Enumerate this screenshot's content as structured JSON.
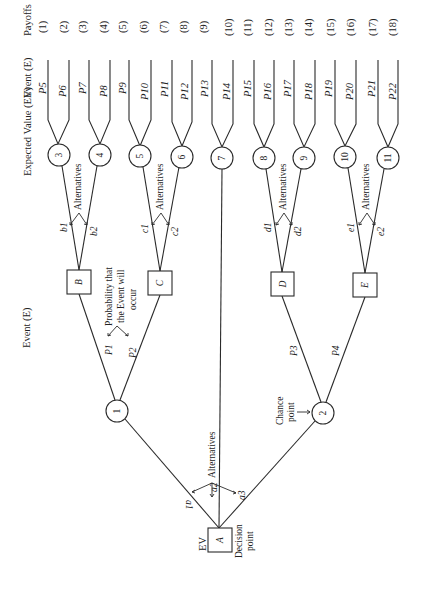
{
  "diagram": {
    "orientation": "rotated-90-ccw",
    "column_headers": {
      "payoffs": "Payoffs",
      "event_top": "Event (E)",
      "expected_value": "Expected Value (EV)",
      "event_bottom": "Event (E)"
    },
    "payoffs": [
      "(1)",
      "(2)",
      "(3)",
      "(4)",
      "(5)",
      "(6)",
      "(7)",
      "(8)",
      "(9)",
      "(10)",
      "(11)",
      "(12)",
      "(13)",
      "(14)",
      "(15)",
      "(16)",
      "(17)",
      "(18)"
    ],
    "events": [
      "P5",
      "P6",
      "P7",
      "P8",
      "P9",
      "P10",
      "P11",
      "P12",
      "P13",
      "P14",
      "P15",
      "P16",
      "P17",
      "P18",
      "P19",
      "P20",
      "P21",
      "P22"
    ],
    "ev_nodes": [
      "3",
      "4",
      "5",
      "6",
      "7",
      "8",
      "9",
      "10",
      "11"
    ],
    "chance_nodes": [
      "1",
      "2"
    ],
    "decision_nodes": [
      "A",
      "B",
      "C",
      "D",
      "E"
    ],
    "branch_labels": {
      "a1": "a1",
      "a2": "a2",
      "a3": "a3",
      "b1": "b1",
      "b2": "b2",
      "c1": "c1",
      "c2": "c2",
      "d1": "d1",
      "d2": "d2",
      "e1": "e1",
      "e2": "e2",
      "p1": "P1",
      "p2": "P2",
      "p3": "P3",
      "p4": "P4"
    },
    "annotations": {
      "alternatives": "Alternatives",
      "probability_line1": "Probability that",
      "probability_line2": "the Event will",
      "probability_line3": "occur",
      "chance_point_line1": "Chance",
      "chance_point_line2": "point",
      "decision_point_line1": "Decision",
      "decision_point_line2": "point",
      "ev": "EV"
    }
  }
}
